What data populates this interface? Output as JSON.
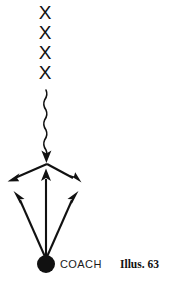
{
  "figure": {
    "caption": "Illus. 63",
    "coach_label": "COACH",
    "background_color": "#ffffff",
    "ink_color": "#111111"
  },
  "players": {
    "symbol": "X",
    "count": 4,
    "marks": [
      {
        "label": "X",
        "x": 45,
        "y": 14
      },
      {
        "label": "X",
        "x": 45,
        "y": 34
      },
      {
        "label": "X",
        "x": 45,
        "y": 54
      },
      {
        "label": "X",
        "x": 45,
        "y": 74
      }
    ]
  },
  "paths": {
    "pass_line": {
      "style": "wavy",
      "direction": "down",
      "from": {
        "x": 46,
        "y": 90
      },
      "to": {
        "x": 46,
        "y": 161
      }
    },
    "cut_left": {
      "style": "straight",
      "direction": "down-left",
      "from": {
        "x": 47,
        "y": 164
      },
      "to": {
        "x": 9,
        "y": 181
      }
    },
    "cut_right": {
      "style": "straight",
      "direction": "down-right",
      "from": {
        "x": 47,
        "y": 164
      },
      "to": {
        "x": 81,
        "y": 182
      }
    },
    "coach_center": {
      "style": "straight",
      "direction": "up",
      "from": {
        "x": 46,
        "y": 259
      },
      "to": {
        "x": 46,
        "y": 170
      }
    },
    "coach_left": {
      "style": "straight",
      "direction": "up-left",
      "from": {
        "x": 46,
        "y": 259
      },
      "to": {
        "x": 14,
        "y": 192
      }
    },
    "coach_right": {
      "style": "straight",
      "direction": "up-right",
      "from": {
        "x": 46,
        "y": 259
      },
      "to": {
        "x": 78,
        "y": 192
      }
    }
  },
  "coach": {
    "marker": "filled-circle",
    "x": 46,
    "y": 264,
    "radius": 9
  }
}
